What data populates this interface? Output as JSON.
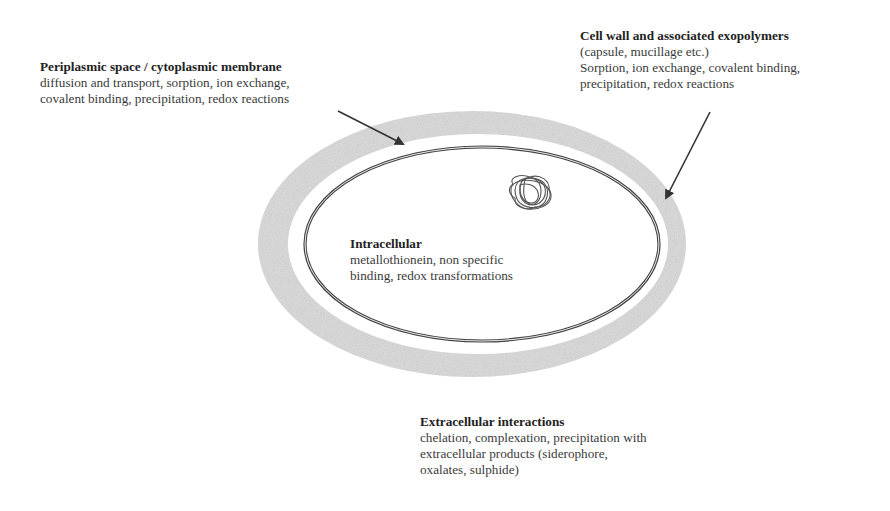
{
  "diagram": {
    "colors": {
      "background": "#ffffff",
      "cell_wall_fill": "#d8d8d8",
      "membrane_stroke": "#444444",
      "arrow": "#333333",
      "text": "#333333"
    },
    "labels": {
      "periplasmic": {
        "title": "Periplasmic space / cytoplasmic membrane",
        "lines": [
          "diffusion and transport, sorption, ion exchange,",
          "covalent binding, precipitation, redox reactions"
        ]
      },
      "cell_wall": {
        "title": "Cell wall and associated exopolymers",
        "lines": [
          "(capsule, mucillage etc.)",
          "Sorption, ion exchange, covalent binding,",
          "precipitation, redox reactions"
        ]
      },
      "intracellular": {
        "title": "Intracellular",
        "lines": [
          "metallothionein, non specific",
          "binding, redox transformations"
        ]
      },
      "extracellular": {
        "title": "Extracellular interactions",
        "lines": [
          "chelation, complexation, precipitation with",
          "extracellular products (siderophore,",
          "oxalates, sulphide)"
        ]
      }
    },
    "elements": {
      "outer_layer": "cell wall / exopolymer layer",
      "inner_membrane": "cytoplasmic membrane",
      "nucleoid": "DNA coil",
      "arrows": [
        "arrow to periplasmic membrane",
        "arrow to cell wall"
      ]
    }
  }
}
